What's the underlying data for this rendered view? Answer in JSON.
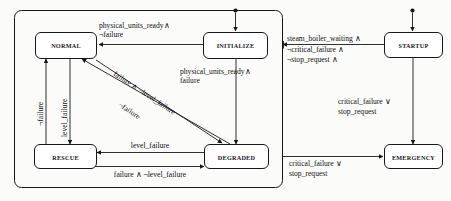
{
  "diagram": {
    "type": "state-transition-diagram",
    "colors": {
      "background": "#fbfbfa",
      "stroke": "#17171a",
      "box_fill": "#ffffff",
      "text": "#101013"
    },
    "outer_region": {
      "name": "normal-operation-region"
    },
    "states": [
      {
        "id": "normal",
        "label": "NORMAL"
      },
      {
        "id": "initialize",
        "label": "INITIALIZE"
      },
      {
        "id": "startup",
        "label": "STARTUP"
      },
      {
        "id": "rescue",
        "label": "RESCUE"
      },
      {
        "id": "degraded",
        "label": "DEGRADED"
      },
      {
        "id": "emergency",
        "label": "EMERGENCY"
      }
    ],
    "initial_markers": [
      {
        "id": "initialize-entry",
        "target": "initialize"
      },
      {
        "id": "startup-entry",
        "target": "startup"
      }
    ],
    "transitions": [
      {
        "id": "initialize-to-normal",
        "from": "initialize",
        "to": "normal",
        "label_lines": [
          "physical_units_ready∧",
          "¬failure"
        ]
      },
      {
        "id": "initialize-to-degraded",
        "from": "initialize",
        "to": "degraded",
        "label_lines": [
          "physical_units_ready∧",
          "failure"
        ]
      },
      {
        "id": "startup-to-normal",
        "from": "startup",
        "to": "normal",
        "label_lines": [
          "steam_boiler_waiting ∧",
          "¬critical_failure ∧",
          "¬stop_request ∧"
        ]
      },
      {
        "id": "startup-to-emergency",
        "from": "startup",
        "to": "emergency",
        "label_lines": [
          "critical_failure ∨",
          "stop_request"
        ]
      },
      {
        "id": "region-to-emergency",
        "from": "normal-operation-region",
        "to": "emergency",
        "label_lines": [
          "critical_failure ∨",
          "stop_request"
        ]
      },
      {
        "id": "rescue-to-normal",
        "from": "rescue",
        "to": "normal",
        "label_lines": [
          "¬failure"
        ]
      },
      {
        "id": "normal-to-rescue",
        "from": "normal",
        "to": "rescue",
        "label_lines": [
          "level_failure"
        ]
      },
      {
        "id": "normal-to-degraded",
        "from": "normal",
        "to": "degraded",
        "label_lines": [
          "failure ∧ ¬level_failure"
        ]
      },
      {
        "id": "degraded-to-normal",
        "from": "degraded",
        "to": "normal",
        "label_lines": [
          "¬failure"
        ]
      },
      {
        "id": "degraded-to-rescue",
        "from": "degraded",
        "to": "rescue",
        "label_lines": [
          "level_failure"
        ]
      },
      {
        "id": "rescue-to-degraded",
        "from": "rescue",
        "to": "degraded",
        "label_lines": [
          "failure ∧ ¬level_failure"
        ]
      }
    ]
  }
}
